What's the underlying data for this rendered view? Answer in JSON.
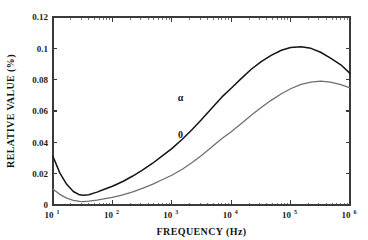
{
  "chart_data": {
    "type": "line",
    "title": "",
    "xlabel": "FREQUENCY (Hz)",
    "ylabel": "RELATIVE VALUE (%)",
    "xscale": "log",
    "yscale": "linear",
    "xlim": [
      10,
      1000000
    ],
    "ylim": [
      0,
      0.12
    ],
    "grid": false,
    "legend_position": "inline-annotations",
    "xticks": [
      {
        "value": 10,
        "label": "10",
        "exponent": "1"
      },
      {
        "value": 100,
        "label": "10",
        "exponent": "2"
      },
      {
        "value": 1000,
        "label": "10",
        "exponent": "3"
      },
      {
        "value": 10000,
        "label": "10",
        "exponent": "4"
      },
      {
        "value": 100000,
        "label": "10",
        "exponent": "5"
      },
      {
        "value": 1000000,
        "label": "10",
        "exponent": "6"
      }
    ],
    "yticks": [
      {
        "value": 0,
        "label": "0"
      },
      {
        "value": 0.02,
        "label": "0.02"
      },
      {
        "value": 0.04,
        "label": "0.04"
      },
      {
        "value": 0.06,
        "label": "0.06"
      },
      {
        "value": 0.08,
        "label": "0.08"
      },
      {
        "value": 0.1,
        "label": "0.1"
      },
      {
        "value": 0.12,
        "label": "0.12"
      }
    ],
    "series": [
      {
        "name": "alpha",
        "label": "α",
        "color": "#141414",
        "annotation": {
          "x": 1400,
          "y": 0.0665
        },
        "x": [
          10,
          13,
          17,
          22,
          28,
          32,
          40,
          55,
          75,
          100,
          150,
          220,
          320,
          470,
          700,
          1000,
          1500,
          2200,
          3200,
          4700,
          7000,
          10000,
          15000,
          22000,
          32000,
          47000,
          70000,
          100000,
          150000,
          220000,
          320000,
          470000,
          700000,
          1000000
        ],
        "y": [
          0.031,
          0.0205,
          0.0132,
          0.0086,
          0.0065,
          0.0062,
          0.0066,
          0.0082,
          0.0102,
          0.012,
          0.015,
          0.0185,
          0.0222,
          0.0265,
          0.0315,
          0.036,
          0.042,
          0.0482,
          0.0548,
          0.0618,
          0.069,
          0.0745,
          0.081,
          0.0868,
          0.0915,
          0.0955,
          0.0988,
          0.1005,
          0.101,
          0.1,
          0.0975,
          0.0938,
          0.0895,
          0.084
        ]
      },
      {
        "name": "zero",
        "label": "0",
        "color": "#6e6e6e",
        "annotation": {
          "x": 1400,
          "y": 0.043
        },
        "x": [
          10,
          13,
          17,
          22,
          28,
          32,
          40,
          55,
          75,
          100,
          150,
          220,
          320,
          470,
          700,
          1000,
          1500,
          2200,
          3200,
          4700,
          7000,
          10000,
          15000,
          22000,
          32000,
          47000,
          70000,
          100000,
          150000,
          220000,
          320000,
          470000,
          700000,
          1000000
        ],
        "y": [
          0.01,
          0.0068,
          0.0044,
          0.003,
          0.0023,
          0.0022,
          0.0024,
          0.0031,
          0.004,
          0.0048,
          0.0064,
          0.0084,
          0.0106,
          0.0132,
          0.0163,
          0.019,
          0.0228,
          0.0272,
          0.0318,
          0.037,
          0.0425,
          0.0468,
          0.0522,
          0.0575,
          0.0622,
          0.0668,
          0.071,
          0.0742,
          0.077,
          0.0784,
          0.079,
          0.0784,
          0.0768,
          0.0748
        ]
      }
    ]
  }
}
